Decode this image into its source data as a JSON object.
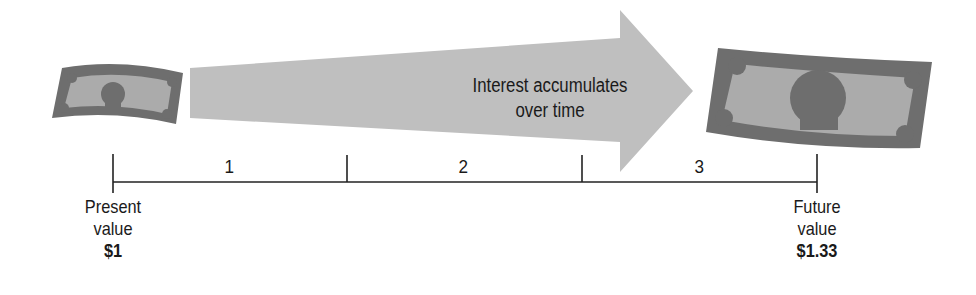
{
  "diagram": {
    "arrow_label_line1": "Interest accumulates",
    "arrow_label_line2": "over time",
    "periods": [
      "1",
      "2",
      "3"
    ],
    "start": {
      "label_line1": "Present",
      "label_line2": "value",
      "amount": "$1"
    },
    "end": {
      "label_line1": "Future",
      "label_line2": "value",
      "amount": "$1.33"
    },
    "icons": {
      "start": "dollar-bill-small",
      "end": "dollar-bill-large",
      "growth": "arrow-right"
    },
    "colors": {
      "bill_border": "#6b6b6b",
      "bill_inner": "#a9a9a9",
      "arrow": "#bdbdbd",
      "line": "#222222"
    }
  }
}
